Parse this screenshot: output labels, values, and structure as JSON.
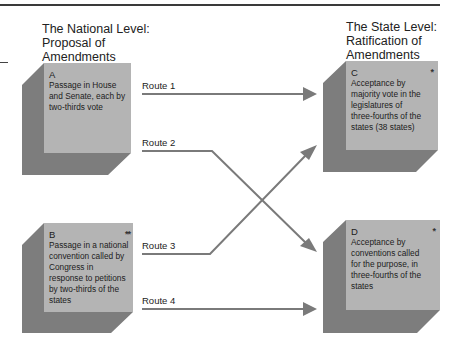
{
  "national_heading": {
    "lines": [
      "The National Level:",
      "Proposal of",
      "Amendments"
    ]
  },
  "state_heading": {
    "lines": [
      "The State Level:",
      "Ratification of",
      "Amendments"
    ]
  },
  "boxes": {
    "A": {
      "letter": "A",
      "marker": "",
      "text": [
        "Passage in House",
        "and Senate, each by",
        "two-thirds vote"
      ]
    },
    "B": {
      "letter": "B",
      "marker": "**",
      "text": [
        "Passage in a national",
        "convention called by",
        "Congress in",
        "response to petitions",
        "by two-thirds of the",
        "states"
      ]
    },
    "C": {
      "letter": "C",
      "marker": "*",
      "text": [
        "Acceptance by",
        "majority vote in the",
        "legislatures of",
        "three-fourths of the",
        "states (38 states)"
      ]
    },
    "D": {
      "letter": "D",
      "marker": "*",
      "text": [
        "Acceptance by",
        "conventions called",
        "for the purpose, in",
        "three-fourths of the",
        "states"
      ]
    }
  },
  "routes": [
    {
      "label": "Route 1",
      "from": "A",
      "to": "C"
    },
    {
      "label": "Route 2",
      "from": "A",
      "to": "D"
    },
    {
      "label": "Route 3",
      "from": "B",
      "to": "C"
    },
    {
      "label": "Route 4",
      "from": "B",
      "to": "D"
    }
  ],
  "colors": {
    "face": "#b4b4b4",
    "shadow": "#7d7d7d",
    "arrow": "#7a7a7a",
    "rule": "#3a3a3a"
  }
}
